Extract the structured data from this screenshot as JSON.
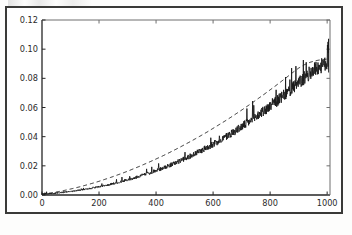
{
  "figure": {
    "background_color": "#ffffff",
    "frame_color": "#3a3a38",
    "axes_color": "#262626"
  },
  "chart_data": {
    "type": "line",
    "title": "",
    "subtitle": "",
    "xlabel": "",
    "ylabel": "",
    "xlim": [
      0,
      1010
    ],
    "ylim": [
      0,
      0.12
    ],
    "grid": false,
    "legend": null,
    "xticks": [
      0,
      200,
      400,
      600,
      800,
      1000
    ],
    "xtick_labels": [
      "0",
      "200",
      "400",
      "600",
      "800",
      "1000"
    ],
    "yticks": [
      0.0,
      0.02,
      0.04,
      0.06,
      0.08,
      0.1,
      0.12
    ],
    "ytick_labels": [
      "0.00",
      "0.02",
      "0.04",
      "0.06",
      "0.08",
      "0.10",
      "0.12"
    ],
    "series": [
      {
        "name": "empirical",
        "style": "solid",
        "color": "#1a1a1a",
        "linewidth": 1.0,
        "noisy": true,
        "x": [
          0,
          20,
          40,
          60,
          80,
          100,
          120,
          140,
          160,
          180,
          200,
          220,
          240,
          260,
          280,
          300,
          320,
          340,
          360,
          380,
          400,
          420,
          440,
          460,
          480,
          500,
          520,
          540,
          560,
          580,
          600,
          620,
          640,
          660,
          680,
          700,
          720,
          740,
          760,
          780,
          800,
          820,
          840,
          860,
          880,
          900,
          920,
          940,
          960,
          980,
          1000,
          1005
        ],
        "y": [
          0.0005,
          0.0008,
          0.0011,
          0.0015,
          0.0019,
          0.0024,
          0.0029,
          0.0035,
          0.0041,
          0.0048,
          0.0056,
          0.0064,
          0.0073,
          0.0082,
          0.0092,
          0.0103,
          0.0114,
          0.0126,
          0.0139,
          0.0152,
          0.0166,
          0.0181,
          0.0196,
          0.0212,
          0.0229,
          0.0247,
          0.0265,
          0.0284,
          0.0304,
          0.0325,
          0.0346,
          0.0368,
          0.0391,
          0.0415,
          0.044,
          0.0465,
          0.0491,
          0.0518,
          0.0546,
          0.0575,
          0.0604,
          0.0634,
          0.0665,
          0.0697,
          0.073,
          0.0763,
          0.0797,
          0.0832,
          0.0862,
          0.088,
          0.0895,
          0.105
        ]
      },
      {
        "name": "theoretical",
        "style": "dashed",
        "color": "#2a2a2a",
        "linewidth": 1.0,
        "noisy": false,
        "x": [
          0,
          20,
          40,
          60,
          80,
          100,
          120,
          140,
          160,
          180,
          200,
          220,
          240,
          260,
          280,
          300,
          320,
          340,
          360,
          380,
          400,
          420,
          440,
          460,
          480,
          500,
          520,
          540,
          560,
          580,
          600,
          620,
          640,
          660,
          680,
          700,
          720,
          740,
          760,
          780,
          800,
          820,
          840,
          860,
          880,
          900,
          920,
          940,
          960,
          980,
          1000
        ],
        "y": [
          0.0006,
          0.0011,
          0.0017,
          0.0024,
          0.0032,
          0.0041,
          0.005,
          0.006,
          0.0071,
          0.0082,
          0.0094,
          0.0107,
          0.012,
          0.0134,
          0.0148,
          0.0163,
          0.0179,
          0.0195,
          0.0212,
          0.0229,
          0.0247,
          0.0265,
          0.0284,
          0.0304,
          0.0324,
          0.0345,
          0.0366,
          0.0388,
          0.041,
          0.0433,
          0.0457,
          0.0481,
          0.0505,
          0.053,
          0.0556,
          0.0582,
          0.0609,
          0.0636,
          0.0664,
          0.0692,
          0.0721,
          0.075,
          0.078,
          0.081,
          0.0841,
          0.087,
          0.0893,
          0.091,
          0.0921,
          0.0928,
          0.0932
        ]
      }
    ],
    "annotations": [
      {
        "name": "end-spike",
        "x": 1003,
        "y_from": 0.088,
        "y_to": 0.105,
        "description": "tall vertical spike in the solid series at the right edge"
      }
    ]
  }
}
